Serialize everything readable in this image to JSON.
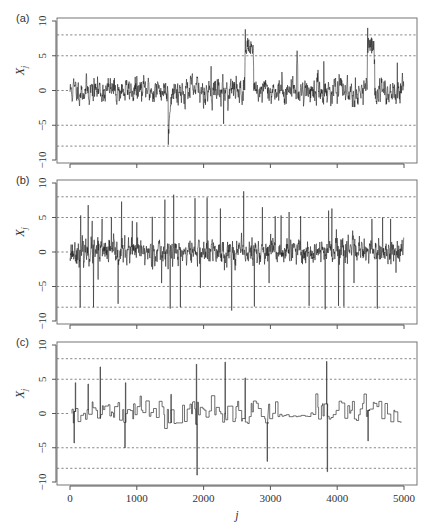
{
  "figure": {
    "x_axis_label": "j",
    "y_axis_label": "X",
    "y_axis_subscript": "j",
    "x_ticks": [
      0,
      1000,
      2000,
      3000,
      4000,
      5000
    ],
    "x_tick_labels": [
      "0",
      "1000",
      "2000",
      "3000",
      "4000",
      "5000"
    ],
    "y_ticks": [
      10,
      5,
      0,
      -5,
      -10
    ],
    "y_tick_labels": [
      "10",
      "5",
      "0",
      "−5",
      "−10"
    ],
    "dashed_reference_lines": [
      8,
      5,
      -5,
      -8
    ]
  },
  "chart_data": [
    {
      "panel": "(a)",
      "type": "line",
      "title": "",
      "xlabel": "",
      "ylabel": "X_j",
      "xlim": [
        0,
        5000
      ],
      "ylim": [
        -10,
        10
      ],
      "grid": "dashed horizontal at y = 8, 5, -5, -8",
      "n_points": 5000,
      "description": "Noisy series around 0 (typical amplitude about +/-2) with level shifts/excursions",
      "features": [
        {
          "x": 1470,
          "y": -7.8,
          "kind": "negative excursion"
        },
        {
          "x": 1550,
          "y": -2.5,
          "kind": "recovery"
        },
        {
          "x": 2110,
          "y": 3.5,
          "kind": "spike"
        },
        {
          "x": 2300,
          "y": -4.8,
          "kind": "spike"
        },
        {
          "x": 2620,
          "y": 8.8,
          "kind": "plateau",
          "width": 130
        },
        {
          "x": 3400,
          "y": 5.5,
          "kind": "bump"
        },
        {
          "x": 3800,
          "y": 4.2,
          "kind": "spike"
        },
        {
          "x": 4450,
          "y": 9.0,
          "kind": "plateau",
          "width": 110
        },
        {
          "x": 4900,
          "y": 4.0,
          "kind": "spike"
        }
      ]
    },
    {
      "panel": "(b)",
      "type": "line",
      "title": "",
      "xlabel": "",
      "ylabel": "X_j",
      "xlim": [
        0,
        5000
      ],
      "ylim": [
        -10,
        10
      ],
      "grid": "dashed horizontal at y = 8, 5, -5, -8",
      "n_points": 5000,
      "description": "Noisy series around 0 (amplitude about +/-2) with many isolated impulsive outliers reaching roughly +/-8",
      "outliers": [
        {
          "x": 150,
          "y": -8.0
        },
        {
          "x": 160,
          "y": 5.3
        },
        {
          "x": 270,
          "y": 6.8
        },
        {
          "x": 330,
          "y": 4.5
        },
        {
          "x": 350,
          "y": -8.0
        },
        {
          "x": 420,
          "y": -4.0
        },
        {
          "x": 480,
          "y": 4.8
        },
        {
          "x": 620,
          "y": 5.0
        },
        {
          "x": 720,
          "y": -7.5
        },
        {
          "x": 770,
          "y": 7.3
        },
        {
          "x": 930,
          "y": 4.5
        },
        {
          "x": 1000,
          "y": 4.3
        },
        {
          "x": 1230,
          "y": 5.1
        },
        {
          "x": 1370,
          "y": -4.5
        },
        {
          "x": 1420,
          "y": 7.6
        },
        {
          "x": 1500,
          "y": -8.2
        },
        {
          "x": 1550,
          "y": 8.3
        },
        {
          "x": 1650,
          "y": -8.0
        },
        {
          "x": 1870,
          "y": 7.8
        },
        {
          "x": 1950,
          "y": -5.2
        },
        {
          "x": 2050,
          "y": 7.9
        },
        {
          "x": 2250,
          "y": 6.3
        },
        {
          "x": 2420,
          "y": -8.5
        },
        {
          "x": 2600,
          "y": 8.8
        },
        {
          "x": 2760,
          "y": -7.9
        },
        {
          "x": 2880,
          "y": 6.5
        },
        {
          "x": 2980,
          "y": -4.5
        },
        {
          "x": 3070,
          "y": 5.2
        },
        {
          "x": 3160,
          "y": 5.3
        },
        {
          "x": 3280,
          "y": 5.8
        },
        {
          "x": 3450,
          "y": 5.2
        },
        {
          "x": 3580,
          "y": -7.8
        },
        {
          "x": 3820,
          "y": -8.3
        },
        {
          "x": 3870,
          "y": 6.0
        },
        {
          "x": 3920,
          "y": 6.3
        },
        {
          "x": 4020,
          "y": -7.8
        },
        {
          "x": 4100,
          "y": -7.9
        },
        {
          "x": 4250,
          "y": -4.5
        },
        {
          "x": 4520,
          "y": 4.8
        },
        {
          "x": 4600,
          "y": -8.2
        },
        {
          "x": 4680,
          "y": 5.0
        },
        {
          "x": 4800,
          "y": 4.8
        },
        {
          "x": 4880,
          "y": -3.0
        }
      ]
    },
    {
      "panel": "(c)",
      "type": "line",
      "title": "",
      "xlabel": "j",
      "ylabel": "X_j",
      "xlim": [
        0,
        5000
      ],
      "ylim": [
        -10,
        10
      ],
      "grid": "dashed horizontal at y = 8, 5, -5, -8",
      "n_points": 5000,
      "description": "Piecewise-constant (step) series around 0 with occasional large spikes",
      "spikes": [
        {
          "x": 60,
          "y": -4.3
        },
        {
          "x": 80,
          "y": 4.5
        },
        {
          "x": 270,
          "y": 4.3
        },
        {
          "x": 450,
          "y": 6.8
        },
        {
          "x": 820,
          "y": -5.0
        },
        {
          "x": 830,
          "y": 4.5
        },
        {
          "x": 1510,
          "y": 2.8
        },
        {
          "x": 1890,
          "y": 7.2
        },
        {
          "x": 1900,
          "y": -9.0
        },
        {
          "x": 2320,
          "y": 7.5
        },
        {
          "x": 2620,
          "y": 5.2
        },
        {
          "x": 2950,
          "y": -7.0
        },
        {
          "x": 3840,
          "y": 7.6
        },
        {
          "x": 3850,
          "y": -8.5
        },
        {
          "x": 4460,
          "y": -4.0
        }
      ],
      "quiet_segment": {
        "x_start": 3100,
        "x_end": 3600,
        "y": -0.3
      }
    }
  ],
  "panels": [
    {
      "label": "(a)"
    },
    {
      "label": "(b)"
    },
    {
      "label": "(c)"
    }
  ]
}
